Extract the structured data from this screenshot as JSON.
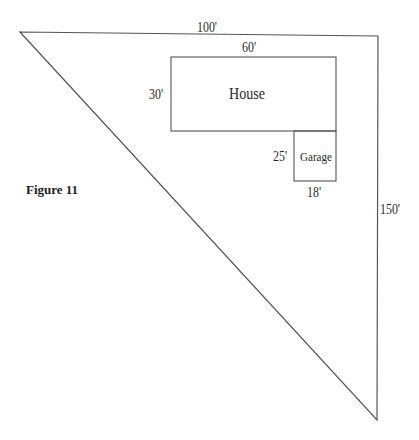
{
  "figure": {
    "caption": "Figure 11",
    "lot": {
      "shape": "right-triangle",
      "top_side_label": "100'",
      "right_side_label": "150'"
    },
    "house": {
      "label": "House",
      "width_label": "60'",
      "height_label": "30'"
    },
    "garage": {
      "label": "Garage",
      "width_label": "18'",
      "height_label": "25'"
    },
    "colors": {
      "line": "#555555",
      "text": "#2a2a2a",
      "background": "#ffffff"
    }
  }
}
